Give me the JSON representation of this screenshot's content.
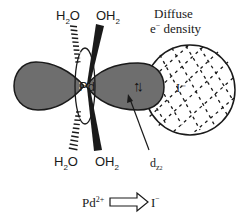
{
  "ligands": {
    "top_left": {
      "base": "H",
      "sub": "2",
      "tail": "O"
    },
    "top_right": {
      "base": "OH",
      "sub": "2"
    },
    "bottom_left": {
      "base": "H",
      "sub": "2",
      "tail": "O"
    },
    "bottom_right": {
      "base": "OH",
      "sub": "2"
    }
  },
  "metal_label": "Pd",
  "anion_label": "I⁻",
  "annotation": {
    "line1": "Diffuse",
    "line2_prefix": "e",
    "line2_sup": "−",
    "line2_suffix": " density"
  },
  "orbital_label": {
    "base": "d",
    "sub": "z",
    "sub_sup": "2"
  },
  "electron_pair": "↑↓",
  "transfer": {
    "donor": "Pd",
    "donor_charge": "2+",
    "acceptor": "I",
    "acceptor_charge": "⁻"
  },
  "colors": {
    "lobe_fill": "#6e6e6e",
    "outline": "#1a1a1a",
    "background": "#ffffff"
  }
}
